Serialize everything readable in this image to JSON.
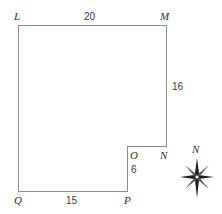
{
  "figure": {
    "kind": "notched-polygon-diagram",
    "stroke_color": "#8d8d8d",
    "fill_color": "#ffffff",
    "background": "#ffffff",
    "text_color": "#2f2f2f",
    "vertices": [
      {
        "name": "L",
        "label": "L",
        "x": 18,
        "y": 25
      },
      {
        "name": "M",
        "label": "M",
        "x": 166,
        "y": 25
      },
      {
        "name": "N",
        "label": "N",
        "x": 166,
        "y": 146
      },
      {
        "name": "O",
        "label": "O",
        "x": 127,
        "y": 146
      },
      {
        "name": "P",
        "label": "P",
        "x": 127,
        "y": 191
      },
      {
        "name": "Q",
        "label": "Q",
        "x": 18,
        "y": 191
      }
    ],
    "path": "M 18 25 L 166 25 L 166 146 L 127 146 L 127 191 L 18 191 Z",
    "dimensions": [
      {
        "name": "top",
        "edge": "L-M",
        "value": "20"
      },
      {
        "name": "right",
        "edge": "M-N",
        "value": "16"
      },
      {
        "name": "notch",
        "edge": "O-P",
        "value": "6"
      },
      {
        "name": "bottom",
        "edge": "Q-P",
        "value": "15"
      }
    ]
  },
  "compass": {
    "label": "N",
    "icon": "compass-rose-icon"
  }
}
